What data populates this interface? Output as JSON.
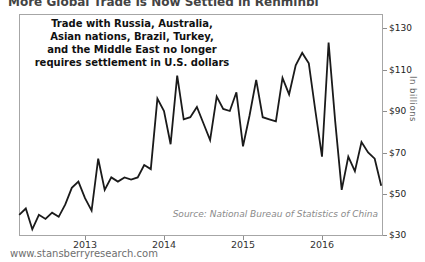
{
  "cropped_header": {
    "text": "More Global Trade Is Now Settled in Renminbi"
  },
  "annotation": {
    "lines": [
      "Trade with Russia, Australia,",
      "Asian nations, Brazil, Turkey,",
      "and the Middle East no longer",
      "requires settlement in U.S. dollars"
    ]
  },
  "y_axis": {
    "unit_label": "In billions",
    "ticks": [
      "$130",
      "$110",
      "$90",
      "$70",
      "$50",
      "$30"
    ]
  },
  "x_axis": {
    "ticks": [
      "2013",
      "2014",
      "2015",
      "2016"
    ]
  },
  "source_note": "Source: National Bureau of Statistics of China",
  "footer": {
    "url": "www.stansberryresearch.com"
  },
  "colors": {
    "line": "#1a1a1a",
    "axis": "#a6a6a6",
    "muted_text": "#8a8a8a"
  },
  "chart_data": {
    "type": "line",
    "title": "",
    "ylabel": "In billions",
    "y_unit": "USD billions",
    "frequency": "monthly",
    "x_start": "2012-03",
    "x_end": "2016-10",
    "x_tick_labels": [
      "2013",
      "2014",
      "2015",
      "2016"
    ],
    "y_ticks": [
      130,
      110,
      90,
      70,
      50,
      30
    ],
    "ylim": [
      27,
      137
    ],
    "grid": false,
    "legend": "none",
    "values": [
      40,
      43,
      33,
      40,
      38,
      41,
      39,
      45,
      53,
      56,
      48,
      42,
      67,
      52,
      58,
      56,
      58,
      57,
      58,
      64,
      62,
      96,
      90,
      74,
      107,
      86,
      87,
      92,
      84,
      76,
      97,
      91,
      90,
      99,
      73,
      88,
      105,
      87,
      86,
      85,
      106,
      98,
      112,
      118,
      113,
      90,
      68,
      123,
      85,
      52,
      68,
      61,
      75,
      70,
      67,
      54
    ],
    "source": "Source: National Bureau of Statistics of China"
  }
}
